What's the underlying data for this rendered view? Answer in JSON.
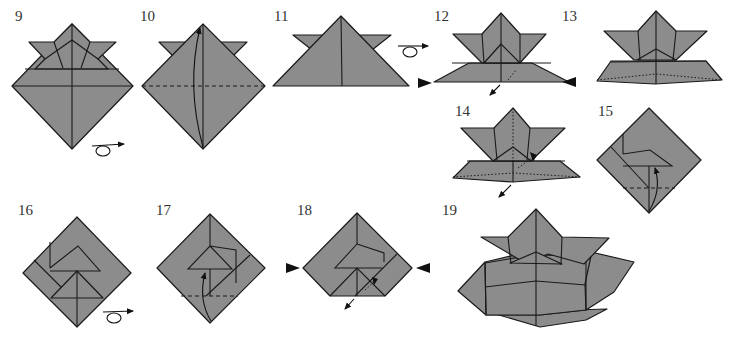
{
  "diagram": {
    "fill_color": "#8c8c8c",
    "line_color": "#1a1a1a",
    "steps": [
      {
        "number": "9",
        "action": "turn-over",
        "shape": "helmet-front-diamond"
      },
      {
        "number": "10",
        "action": "valley-fold-up",
        "shape": "diamond-with-horns"
      },
      {
        "number": "11",
        "action": "turn-over",
        "shape": "triangle-with-horns"
      },
      {
        "number": "12",
        "action": "open-and-squash",
        "shape": "helmet"
      },
      {
        "number": "13",
        "action": "squash",
        "shape": "helmet-flattened"
      },
      {
        "number": "14",
        "action": "pull-out",
        "shape": "helmet-inside"
      },
      {
        "number": "15",
        "action": "fold-up",
        "shape": "square-diamond"
      },
      {
        "number": "16",
        "action": "turn-over",
        "shape": "square-diamond-folded"
      },
      {
        "number": "17",
        "action": "fold-up",
        "shape": "square-diamond-back"
      },
      {
        "number": "18",
        "action": "open-and-squash",
        "shape": "pentagon"
      },
      {
        "number": "19",
        "action": "complete",
        "shape": "finished-helmet"
      }
    ]
  }
}
